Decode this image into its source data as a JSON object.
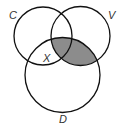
{
  "diagram": {
    "type": "venn",
    "sets": [
      {
        "id": "C",
        "label": "C",
        "cx": 43,
        "cy": 36,
        "r": 29
      },
      {
        "id": "V",
        "label": "V",
        "cx": 80.5,
        "cy": 36,
        "r": 29.5
      },
      {
        "id": "D",
        "label": "D",
        "cx": 62.5,
        "cy": 75,
        "r": 37.5
      }
    ],
    "region_labels": [
      {
        "label": "X",
        "region": "C ∩ D only"
      }
    ],
    "shaded_region": "V ∩ D",
    "colors": {
      "stroke": "#111111",
      "shade": "#8c8c8c",
      "background": "#ffffff"
    }
  }
}
